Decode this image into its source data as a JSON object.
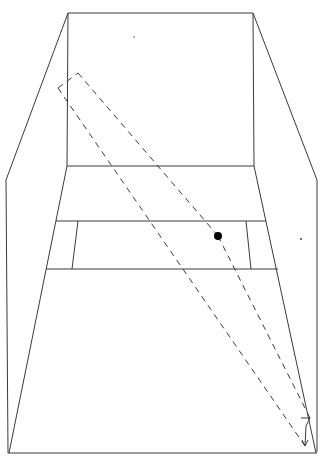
{
  "diagram": {
    "type": "perspective-line-drawing",
    "colors": {
      "line": "#3a3a3a",
      "dot": "#000000",
      "background": "#ffffff"
    },
    "back_wall": {
      "points": [
        [
          68,
          13
        ],
        [
          253,
          13
        ],
        [
          254,
          166
        ],
        [
          67,
          166
        ]
      ]
    },
    "outer_left": {
      "points": [
        [
          68,
          13
        ],
        [
          6,
          180
        ],
        [
          8,
          453
        ]
      ]
    },
    "outer_right": {
      "points": [
        [
          253,
          13
        ],
        [
          317,
          180
        ],
        [
          317,
          452
        ]
      ]
    },
    "floor_edges": {
      "left": [
        [
          67,
          166
        ],
        [
          9,
          453
        ]
      ],
      "right": [
        [
          254,
          166
        ],
        [
          316,
          453
        ]
      ],
      "bottom": [
        [
          9,
          453
        ],
        [
          316,
          453
        ]
      ],
      "band_top": [
        [
          56,
          221
        ],
        [
          266,
          221
        ]
      ],
      "band_bottom": [
        [
          46,
          269
        ],
        [
          278,
          269
        ]
      ],
      "inner_left": [
        [
          78,
          221
        ],
        [
          72,
          269
        ]
      ],
      "inner_right": [
        [
          246,
          221
        ],
        [
          251,
          269
        ]
      ]
    },
    "dashed_rect": {
      "points": [
        [
          58,
          88
        ],
        [
          78,
          73
        ],
        [
          310,
          418
        ],
        [
          305,
          446
        ]
      ]
    },
    "dot": {
      "cx": 218,
      "cy": 236,
      "r": 4
    },
    "specks": [
      [
        134,
        37
      ],
      [
        301,
        239
      ]
    ]
  }
}
